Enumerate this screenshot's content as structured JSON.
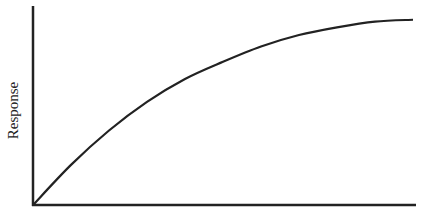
{
  "chart_data": {
    "type": "line",
    "title": "",
    "xlabel": "",
    "ylabel": "Response",
    "grid": false,
    "legend": null,
    "x": [
      0,
      0.1,
      0.2,
      0.3,
      0.4,
      0.5,
      0.6,
      0.7,
      0.8,
      0.9,
      1.0
    ],
    "series": [
      {
        "name": "response-curve",
        "values": [
          0,
          0.21,
          0.39,
          0.54,
          0.66,
          0.75,
          0.83,
          0.89,
          0.93,
          0.96,
          0.97
        ]
      }
    ],
    "xlim": [
      0,
      1
    ],
    "ylim": [
      0,
      1
    ],
    "color": "#222222"
  }
}
